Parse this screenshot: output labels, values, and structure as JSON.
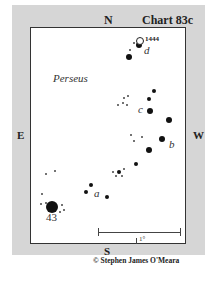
{
  "chart": {
    "title": "Chart 83c",
    "constellation": "Perseus",
    "directions": {
      "north": "N",
      "south": "S",
      "east": "E",
      "west": "W"
    },
    "scale_label": "1°",
    "credit": "© Stephen James O'Meara"
  },
  "objects": [
    {
      "name": "1444",
      "type": "open-cluster",
      "x": 140,
      "y": 41
    }
  ],
  "star_labels": [
    {
      "text": "d",
      "x": 144,
      "y": 45
    },
    {
      "text": "c",
      "x": 138,
      "y": 104
    },
    {
      "text": "b",
      "x": 169,
      "y": 139
    },
    {
      "text": "a",
      "x": 94,
      "y": 188
    },
    {
      "text": "43",
      "x": 46,
      "y": 212
    }
  ],
  "stars": [
    {
      "x": 134,
      "y": 43,
      "size": 1
    },
    {
      "x": 139,
      "y": 45,
      "size": 3
    },
    {
      "x": 130,
      "y": 50,
      "size": 1
    },
    {
      "x": 129,
      "y": 57,
      "size": 3
    },
    {
      "x": 154,
      "y": 91,
      "size": 2
    },
    {
      "x": 149,
      "y": 99,
      "size": 2
    },
    {
      "x": 150,
      "y": 111,
      "size": 3
    },
    {
      "x": 169,
      "y": 120,
      "size": 3
    },
    {
      "x": 124,
      "y": 98,
      "size": 1
    },
    {
      "x": 128,
      "y": 96,
      "size": 1
    },
    {
      "x": 123,
      "y": 103,
      "size": 1
    },
    {
      "x": 118,
      "y": 105,
      "size": 1
    },
    {
      "x": 127,
      "y": 105,
      "size": 1
    },
    {
      "x": 131,
      "y": 135,
      "size": 1
    },
    {
      "x": 134,
      "y": 141,
      "size": 1
    },
    {
      "x": 142,
      "y": 137,
      "size": 1
    },
    {
      "x": 162,
      "y": 139,
      "size": 3
    },
    {
      "x": 149,
      "y": 150,
      "size": 3
    },
    {
      "x": 136,
      "y": 164,
      "size": 2
    },
    {
      "x": 119,
      "y": 172,
      "size": 2
    },
    {
      "x": 113,
      "y": 172,
      "size": 1
    },
    {
      "x": 124,
      "y": 169,
      "size": 1
    },
    {
      "x": 116,
      "y": 176,
      "size": 1
    },
    {
      "x": 122,
      "y": 176,
      "size": 1
    },
    {
      "x": 46,
      "y": 174,
      "size": 1
    },
    {
      "x": 55,
      "y": 171,
      "size": 1
    },
    {
      "x": 91,
      "y": 185,
      "size": 2
    },
    {
      "x": 86,
      "y": 192,
      "size": 2
    },
    {
      "x": 107,
      "y": 197,
      "size": 2
    },
    {
      "x": 42,
      "y": 194,
      "size": 1
    },
    {
      "x": 52,
      "y": 207,
      "size": 4
    },
    {
      "x": 41,
      "y": 204,
      "size": 1
    },
    {
      "x": 46,
      "y": 203,
      "size": 1
    },
    {
      "x": 62,
      "y": 205,
      "size": 1
    },
    {
      "x": 64,
      "y": 210,
      "size": 1
    },
    {
      "x": 60,
      "y": 212,
      "size": 1
    }
  ]
}
